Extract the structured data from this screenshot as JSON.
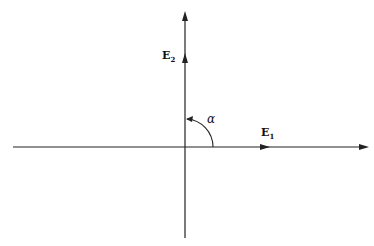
{
  "diagram": {
    "type": "coordinate-axes",
    "stroke_color": "#222222",
    "axes": {
      "horizontal": {
        "x1": 13,
        "x2": 368,
        "y": 147
      },
      "vertical": {
        "x": 185,
        "y1": 12,
        "y2": 238
      }
    },
    "vectors": [
      {
        "name": "E1",
        "label_main": "E",
        "label_sub": "1",
        "direction": "horizontal",
        "arrow_at": [
          268,
          147
        ]
      },
      {
        "name": "E2",
        "label_main": "E",
        "label_sub": "2",
        "direction": "vertical",
        "arrow_at": [
          185,
          55
        ]
      }
    ],
    "angle": {
      "symbol": "α",
      "from": "E1",
      "to": "E2",
      "radius": 28
    }
  }
}
